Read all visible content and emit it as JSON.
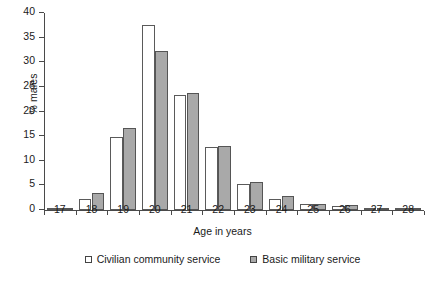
{
  "chart_data": {
    "type": "bar",
    "title": "",
    "xlabel": "Age in years",
    "ylabel": "% males",
    "categories": [
      "17",
      "18",
      "19",
      "20",
      "21",
      "22",
      "23",
      "24",
      "25",
      "26",
      "27",
      "28"
    ],
    "series": [
      {
        "name": "Civilian community service",
        "color": "#ffffff",
        "values": [
          0.3,
          2.2,
          14.9,
          37.5,
          23.4,
          12.7,
          5.2,
          2.3,
          1.3,
          0.8,
          0.2,
          0.2
        ]
      },
      {
        "name": "Basic military service",
        "color": "#a9a9a9",
        "values": [
          0.2,
          3.4,
          16.6,
          32.3,
          23.7,
          13.0,
          5.7,
          2.9,
          1.2,
          1.1,
          0.3,
          0.2
        ]
      }
    ],
    "ylim": [
      0,
      40
    ],
    "yticks": [
      0,
      5,
      10,
      15,
      20,
      25,
      30,
      35,
      40
    ],
    "ytick_labels": [
      "0",
      "5",
      "10",
      "15",
      "20",
      "25",
      "30",
      "35",
      "40"
    ],
    "grid": false,
    "legend_position": "bottom"
  },
  "legend": {
    "entries": [
      {
        "label": "Civilian community service",
        "marker": "open-square-marker"
      },
      {
        "label": "Basic military service",
        "marker": "filled-square-marker"
      }
    ]
  },
  "axes": {
    "x_title": "Age in years",
    "y_title": "% males"
  }
}
